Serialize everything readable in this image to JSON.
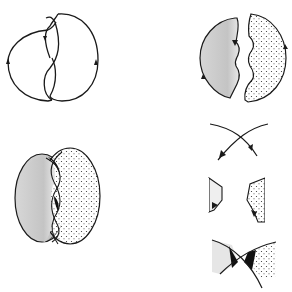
{
  "figure": {
    "colors": {
      "stroke": "#1a1a1a",
      "gray_fill": "#c8c8c8",
      "dot_fill": "#333333",
      "background": "#ffffff",
      "dark_band": "#111111"
    },
    "panels": [
      {
        "id": "link-diagram",
        "label": "oriented link diagram with two crossings"
      },
      {
        "id": "seifert-disks",
        "label": "two Seifert disks: shaded gray and dotted"
      },
      {
        "id": "surface-with-bands",
        "label": "disks joined with twisted bands at crossings"
      },
      {
        "id": "crossing-detail",
        "label": "single crossing detail"
      },
      {
        "id": "disk-edges-detail",
        "label": "smoothed crossing with disk edges"
      },
      {
        "id": "band-detail",
        "label": "twisted band connecting disks"
      }
    ]
  }
}
